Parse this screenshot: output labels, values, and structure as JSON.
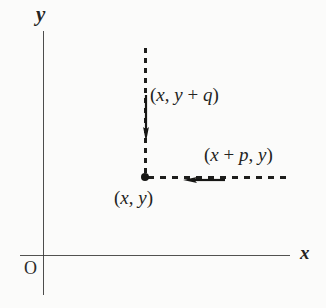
{
  "figure": {
    "type": "cartesian-coordinate-diagram",
    "background_color": "#fbfbfa",
    "ink_color": "#232321",
    "axes": {
      "x_axis_label": "x",
      "y_axis_label": "y",
      "origin_label": "O"
    },
    "labels": {
      "point_label": "(x, y)",
      "vertical_translate_label": "(x, y + q)",
      "horizontal_translate_label": "(x + p, y)"
    },
    "label_parts": {
      "point": {
        "open": "(",
        "var1": "x",
        "comma": ", ",
        "var2": "y",
        "close": ")"
      },
      "vertical": {
        "open": "(",
        "var1": "x",
        "comma": ", ",
        "var2": "y",
        "op": " + ",
        "var3": "q",
        "close": ")"
      },
      "horizontal": {
        "open": "(",
        "var1": "x",
        "op": " + ",
        "var2": "p",
        "comma": ", ",
        "var3": "y",
        "close": ")"
      }
    },
    "vectors": [
      {
        "name": "vertical-vector",
        "direction": "down",
        "from_label": "(x, y + q)",
        "to_label": "(x, y)"
      },
      {
        "name": "horizontal-vector",
        "direction": "left",
        "from_label": "(x + p, y)",
        "to_label": "(x, y)"
      }
    ]
  }
}
